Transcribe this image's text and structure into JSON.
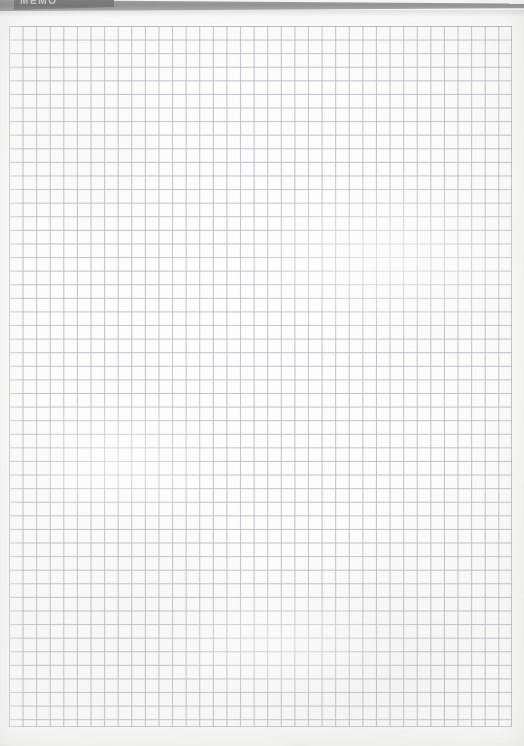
{
  "document": {
    "kind": "scanned-grid-paper-sheet",
    "title_text": "MEMO",
    "title_visible_note": "top of lettering cropped by page edge"
  },
  "banner": {
    "label": "MEMO",
    "bar_color": "#8e8e8e",
    "block_color": "#767676",
    "text_color": "#d8d8d8"
  },
  "grid": {
    "line_color": "#b9bcc3",
    "cell_size_px": 13.6,
    "columns": 37,
    "rows": 52,
    "left_px": 9,
    "top_px": 26,
    "width_px": 503,
    "height_px": 701
  },
  "paper": {
    "background_color": "#fdfdfd",
    "texture": "faint scan noise and fibre streaks"
  }
}
